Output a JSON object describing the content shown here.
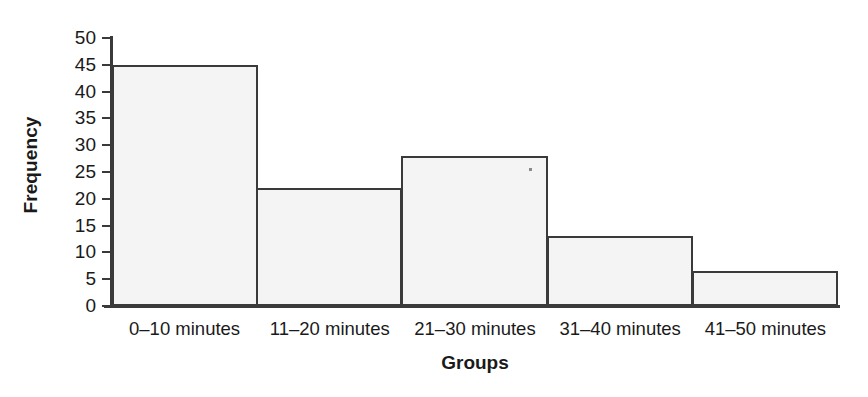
{
  "chart_data": {
    "type": "bar",
    "title": "",
    "subtitle": "",
    "xlabel": "Groups",
    "ylabel": "Frequency",
    "categories": [
      "0–10 minutes",
      "11–20 minutes",
      "21–30 minutes",
      "31–40 minutes",
      "41–50 minutes"
    ],
    "values": [
      45,
      22,
      28,
      13,
      6.5
    ],
    "ylim": [
      0,
      50
    ],
    "ytick_labels": [
      "50",
      "45",
      "40",
      "35",
      "30",
      "25",
      "20",
      "15",
      "10",
      "5",
      "0"
    ],
    "ytick_values": [
      50,
      45,
      40,
      35,
      30,
      25,
      20,
      15,
      10,
      5,
      0
    ],
    "ytick_step": 5,
    "grid": false,
    "legend": null,
    "legend_position": "none",
    "bar_style": "histogram-adjacent",
    "colors": {
      "bar_fill": "#f4f4f4",
      "bar_border": "#3a3a3a",
      "axis": "#3a3a3a",
      "text": "#1a1a1a",
      "background": "#ffffff"
    }
  }
}
